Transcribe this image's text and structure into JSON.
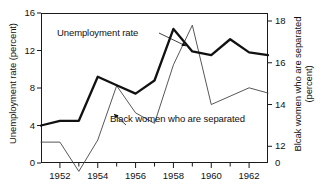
{
  "chart_data": {
    "type": "line",
    "title": "",
    "xlabel": "",
    "x": [
      1951,
      1952,
      1953,
      1954,
      1955,
      1956,
      1957,
      1958,
      1959,
      1960,
      1961,
      1962,
      1963
    ],
    "xlim": [
      1951,
      1963
    ],
    "xticks_major": [
      1952,
      1954,
      1956,
      1958,
      1960,
      1962
    ],
    "xticks_minor": [
      1951,
      1953,
      1955,
      1957,
      1959,
      1961,
      1963
    ],
    "xtick_labels": [
      "1952",
      "1954",
      "1956",
      "1958",
      "1960",
      "1962"
    ],
    "grid": false,
    "legend_position": "inline-annotations",
    "left_axis": {
      "label": "Unemployment rate (percent)",
      "ylim": [
        0,
        16
      ],
      "ticks": [
        0,
        4,
        8,
        12,
        16
      ],
      "tick_labels": [
        "0",
        "4",
        "8",
        "12",
        "16"
      ]
    },
    "right_axis": {
      "label_line1": "Blcak women who are separated",
      "label_line2": "(percent)",
      "ylim": [
        0,
        18
      ],
      "ticks": [
        0,
        12,
        14,
        16,
        18
      ],
      "tick_labels": [
        "0",
        "12",
        "14",
        "16",
        "18"
      ],
      "note": "axis is broken: 0 shown at baseline, scale runs 11.2 to 18"
    },
    "series": [
      {
        "name": "Unemployment rate",
        "axis": "left",
        "style": "thick-black",
        "color": "#111111",
        "line_width": 2.3,
        "values": [
          4.0,
          4.5,
          4.5,
          9.2,
          8.3,
          7.4,
          8.8,
          14.3,
          11.9,
          11.5,
          13.2,
          11.8,
          11.5
        ]
      },
      {
        "name": "Black women who are separated",
        "axis": "right",
        "style": "thin-black",
        "color": "#444444",
        "line_width": 0.9,
        "values": [
          12.2,
          12.2,
          10.8,
          12.3,
          14.9,
          13.6,
          13.1,
          15.9,
          17.8,
          14.0,
          14.4,
          14.8,
          14.55
        ]
      }
    ],
    "annotations": [
      {
        "text": "Unemployment rate",
        "points_to_series": "Unemployment rate",
        "leader": true
      },
      {
        "text": "Black women who are separated",
        "points_to_series": "Black women who are separated",
        "leader": true
      }
    ]
  }
}
